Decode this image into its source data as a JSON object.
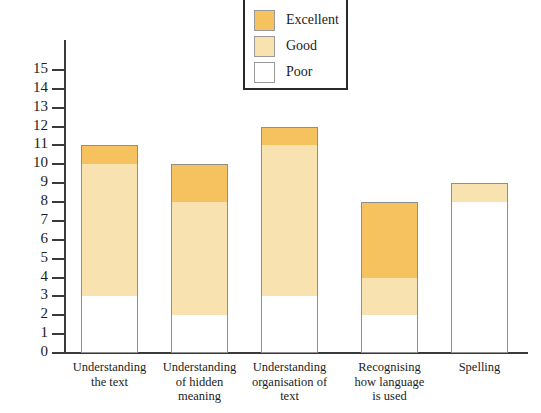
{
  "chart_data": {
    "type": "bar",
    "subtype": "stacked",
    "title": "",
    "xlabel": "",
    "ylabel": "",
    "ylim": [
      0,
      15
    ],
    "grid": false,
    "legend_position": "top-center",
    "categories": [
      "Understanding\nthe text",
      "Understanding\nof hidden\nmeaning",
      "Understanding\norganisation of\ntext",
      "Recognising\nhow language\nis used",
      "Spelling"
    ],
    "category_lines": [
      [
        "Understanding",
        "the text"
      ],
      [
        "Understanding",
        "of hidden",
        "meaning"
      ],
      [
        "Understanding",
        "organisation of",
        "text"
      ],
      [
        "Recognising",
        "how language",
        "is used"
      ],
      [
        "Spelling"
      ]
    ],
    "series": [
      {
        "name": "Excellent",
        "color": "#f6c260",
        "values": [
          1,
          2,
          1,
          4,
          0
        ]
      },
      {
        "name": "Good",
        "color": "#f8e3b0",
        "values": [
          7,
          6,
          8,
          2,
          1
        ]
      },
      {
        "name": "Poor",
        "color": "#ffffff",
        "values": [
          3,
          2,
          3,
          2,
          8
        ]
      }
    ],
    "totals": [
      11,
      10,
      12,
      8,
      9
    ],
    "y_ticks": [
      15,
      14,
      13,
      12,
      11,
      10,
      9,
      8,
      7,
      6,
      5,
      4,
      3,
      2,
      1,
      0
    ],
    "y_tick_labels": [
      "15",
      "14",
      "13",
      "12",
      "11",
      "10",
      "9",
      "8",
      "7",
      "6",
      "5",
      "4",
      "3",
      "2",
      "1",
      "0"
    ]
  },
  "legend": {
    "items": [
      {
        "label": "Excellent",
        "color": "#f6c260"
      },
      {
        "label": "Good",
        "color": "#f8e3b0"
      },
      {
        "label": "Poor",
        "color": "#ffffff"
      }
    ]
  },
  "colors": {
    "excellent": "#f6c260",
    "good": "#f8e3b0",
    "poor": "#ffffff",
    "axis": "#3a3a3a",
    "bar_border": "#8e8e8e",
    "legend_border": "#2a2a2a",
    "text": "#1c1c1c",
    "background": "#ffffff"
  }
}
